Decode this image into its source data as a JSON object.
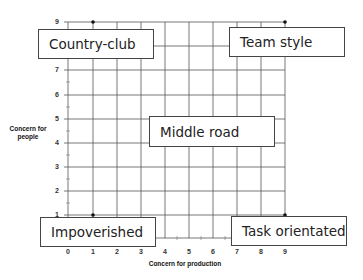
{
  "diagram": {
    "type": "managerial-grid",
    "x_axis": {
      "label": "Concern for production",
      "ticks": [
        "0",
        "1",
        "2",
        "3",
        "4",
        "5",
        "6",
        "7",
        "8",
        "9"
      ]
    },
    "y_axis": {
      "label_line1": "Concern for",
      "label_line2": "people",
      "ticks": [
        "1",
        "2",
        "3",
        "4",
        "5",
        "6",
        "7",
        "9"
      ]
    },
    "boxes": {
      "country_club": "Country-club",
      "team_style": "Team style",
      "middle_road": "Middle road",
      "impoverished": "Impoverished",
      "task_orientated": "Task orientated"
    },
    "points": [
      {
        "name": "country-club",
        "x": 1,
        "y": 9
      },
      {
        "name": "team-style",
        "x": 9,
        "y": 9
      },
      {
        "name": "impoverished",
        "x": 1,
        "y": 1
      },
      {
        "name": "task-orientated",
        "x": 9,
        "y": 1
      }
    ],
    "colors": {
      "grid": "#555555",
      "box_border": "#444444",
      "text": "#222222"
    }
  }
}
